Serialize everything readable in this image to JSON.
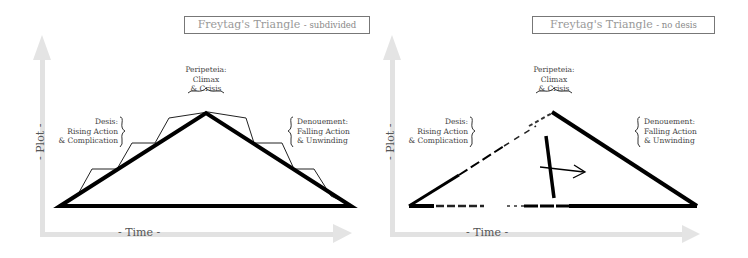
{
  "panels": [
    {
      "id": "subdivided",
      "title": "Freytag's Triangle",
      "title_suffix": "- subdivided",
      "axis": {
        "x_label": "- Time -",
        "y_label": "- Plot -"
      },
      "labels": {
        "peripeteia": [
          "Peripeteia:",
          "Climax",
          "& Crisis"
        ],
        "desis": [
          "Desis:",
          "Rising Action",
          "& Complication"
        ],
        "denouement": [
          "Denouement:",
          "Falling Action",
          "& Unwinding"
        ]
      }
    },
    {
      "id": "no-desis",
      "title": "Freytag's Triangle",
      "title_suffix": "- no desis",
      "axis": {
        "x_label": "- Time -",
        "y_label": "- Plot -"
      },
      "labels": {
        "peripeteia": [
          "Peripeteia:",
          "Climax",
          "& Crisis"
        ],
        "desis": [
          "Desis:",
          "Rising Action",
          "& Complication"
        ],
        "denouement": [
          "Denouement:",
          "Falling Action",
          "& Unwinding"
        ]
      }
    }
  ],
  "colors": {
    "stroke": "#000000",
    "axis": "#dcdcdc",
    "title_border": "#777777",
    "title_text": "#999999"
  }
}
